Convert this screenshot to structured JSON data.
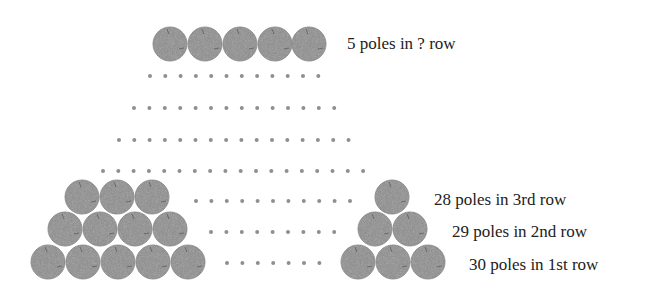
{
  "diagram": {
    "colors": {
      "pole_fill": "#8e8e8e",
      "pole_edge": "#7a7a7a",
      "dot": "#8f8f8f",
      "text": "#222222"
    },
    "labels": [
      {
        "id": "top_row",
        "text": "5 poles in ? row",
        "x": 347,
        "y": 35
      },
      {
        "id": "row3",
        "text": "28 poles in 3rd row",
        "x": 434,
        "y": 191
      },
      {
        "id": "row2",
        "text": "29 poles in 2nd row",
        "x": 452,
        "y": 223
      },
      {
        "id": "row1",
        "text": "30 poles in 1st row",
        "x": 469,
        "y": 256
      }
    ],
    "pole_radius": 17,
    "pole_groups": [
      {
        "name": "top-row",
        "rows": [
          {
            "y": 44,
            "xs": [
              170,
              205,
              240,
              275,
              309
            ]
          }
        ]
      },
      {
        "name": "left-pile",
        "rows": [
          {
            "y": 197,
            "xs": [
              82,
              117,
              152
            ]
          },
          {
            "y": 229,
            "xs": [
              65,
              100,
              135,
              170
            ]
          },
          {
            "y": 262,
            "xs": [
              48,
              83,
              118,
              153,
              188
            ]
          }
        ]
      },
      {
        "name": "right-pile",
        "rows": [
          {
            "y": 197,
            "xs": [
              392
            ]
          },
          {
            "y": 229,
            "xs": [
              375,
              410
            ]
          },
          {
            "y": 262,
            "xs": [
              358,
              393,
              428
            ]
          }
        ]
      }
    ],
    "dot_rows": [
      {
        "y": 76,
        "x_start": 150,
        "count": 12,
        "step": 15.3
      },
      {
        "y": 108,
        "x_start": 134,
        "count": 14,
        "step": 15.4
      },
      {
        "y": 140,
        "x_start": 119,
        "count": 16,
        "step": 15.3
      },
      {
        "y": 171,
        "x_start": 103,
        "count": 18,
        "step": 15.3
      },
      {
        "y": 201,
        "x_start": 196,
        "count": 11,
        "step": 15.4
      },
      {
        "y": 232,
        "x_start": 211,
        "count": 9,
        "step": 15.4
      },
      {
        "y": 263,
        "x_start": 227,
        "count": 7,
        "step": 15.4
      }
    ]
  }
}
